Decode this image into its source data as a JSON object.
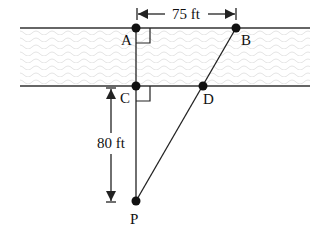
{
  "diagram": {
    "points": {
      "A": {
        "label": "A",
        "x": 136,
        "y": 28
      },
      "B": {
        "label": "B",
        "x": 236,
        "y": 28
      },
      "C": {
        "label": "C",
        "x": 136,
        "y": 86
      },
      "D": {
        "label": "D",
        "x": 203,
        "y": 86
      },
      "P": {
        "label": "P",
        "x": 136,
        "y": 201
      }
    },
    "dimensions": {
      "width_ab": "75 ft",
      "distance_cp": "80 ft"
    },
    "river": {
      "top_y": 28,
      "bottom_y": 86,
      "x_start": 20,
      "x_end": 310
    }
  }
}
